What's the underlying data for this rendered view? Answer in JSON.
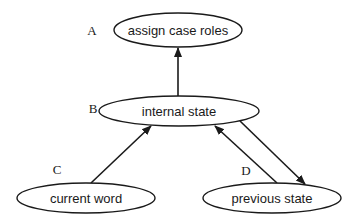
{
  "diagram": {
    "type": "directed-graph",
    "nodes": [
      {
        "id": "A",
        "letter": "A",
        "label": "assign case roles",
        "cx": 178,
        "cy": 30,
        "rx": 64,
        "ry": 17
      },
      {
        "id": "B",
        "letter": "B",
        "label": "internal state",
        "cx": 179,
        "cy": 111,
        "rx": 80,
        "ry": 15
      },
      {
        "id": "C",
        "letter": "C",
        "label": "current word",
        "cx": 86,
        "cy": 198,
        "rx": 69,
        "ry": 15
      },
      {
        "id": "D",
        "letter": "D",
        "label": "previous state",
        "cx": 272,
        "cy": 198,
        "rx": 69,
        "ry": 15
      }
    ],
    "edges": [
      {
        "from": "B",
        "to": "A"
      },
      {
        "from": "C",
        "to": "B"
      },
      {
        "from": "D",
        "to": "B"
      },
      {
        "from": "B",
        "to": "D"
      }
    ],
    "letters": {
      "A": "A",
      "B": "B",
      "C": "C",
      "D": "D"
    },
    "labels": {
      "A": "assign case roles",
      "B": "internal state",
      "C": "current word",
      "D": "previous state"
    },
    "colors": {
      "stroke": "#1a1a1a",
      "background": "#ffffff"
    }
  }
}
